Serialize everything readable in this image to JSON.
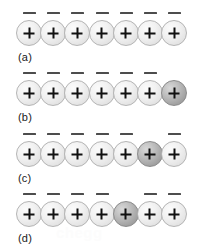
{
  "figure": {
    "background_color": "#ffffff",
    "ion_fill_color": "#eeeeee",
    "ion_shaded_color": "#a8a8a8",
    "ion_border_color": "#b4b4b4",
    "dash_color": "#4d4d4d",
    "charge_symbol": "+",
    "dash_symbol": "–",
    "sites_per_row": 7,
    "rows": [
      {
        "label": "(a)",
        "top": 8,
        "shaded_index": -1,
        "sites": [
          {
            "charge": "+",
            "dash": true,
            "shaded": false
          },
          {
            "charge": "+",
            "dash": true,
            "shaded": false
          },
          {
            "charge": "+",
            "dash": true,
            "shaded": false
          },
          {
            "charge": "+",
            "dash": true,
            "shaded": false
          },
          {
            "charge": "+",
            "dash": true,
            "shaded": false
          },
          {
            "charge": "+",
            "dash": true,
            "shaded": false
          },
          {
            "charge": "+",
            "dash": true,
            "shaded": false
          }
        ]
      },
      {
        "label": "(b)",
        "top": 68,
        "shaded_index": 6,
        "sites": [
          {
            "charge": "+",
            "dash": true,
            "shaded": false
          },
          {
            "charge": "+",
            "dash": true,
            "shaded": false
          },
          {
            "charge": "+",
            "dash": true,
            "shaded": false
          },
          {
            "charge": "+",
            "dash": true,
            "shaded": false
          },
          {
            "charge": "+",
            "dash": true,
            "shaded": false
          },
          {
            "charge": "+",
            "dash": true,
            "shaded": false
          },
          {
            "charge": "+",
            "dash": false,
            "shaded": true
          }
        ]
      },
      {
        "label": "(c)",
        "top": 129,
        "shaded_index": 5,
        "sites": [
          {
            "charge": "+",
            "dash": true,
            "shaded": false
          },
          {
            "charge": "+",
            "dash": true,
            "shaded": false
          },
          {
            "charge": "+",
            "dash": true,
            "shaded": false
          },
          {
            "charge": "+",
            "dash": true,
            "shaded": false
          },
          {
            "charge": "+",
            "dash": true,
            "shaded": false
          },
          {
            "charge": "+",
            "dash": false,
            "shaded": true
          },
          {
            "charge": "+",
            "dash": true,
            "shaded": false
          }
        ]
      },
      {
        "label": "(d)",
        "top": 189,
        "shaded_index": 4,
        "sites": [
          {
            "charge": "+",
            "dash": true,
            "shaded": false
          },
          {
            "charge": "+",
            "dash": true,
            "shaded": false
          },
          {
            "charge": "+",
            "dash": true,
            "shaded": false
          },
          {
            "charge": "+",
            "dash": true,
            "shaded": false
          },
          {
            "charge": "+",
            "dash": false,
            "shaded": true
          },
          {
            "charge": "+",
            "dash": true,
            "shaded": false
          },
          {
            "charge": "+",
            "dash": true,
            "shaded": false
          }
        ]
      }
    ],
    "watermark": "chegg"
  }
}
